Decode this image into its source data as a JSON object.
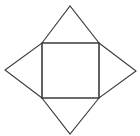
{
  "diagram": {
    "type": "square-pyramid-net",
    "width": 140,
    "height": 136,
    "background": "#ffffff",
    "stroke_color": "#3a3a3a",
    "square": {
      "top_left": [
        42,
        43
      ],
      "top_right": [
        99,
        43
      ],
      "bottom_right": [
        99,
        98
      ],
      "bottom_left": [
        42,
        98
      ]
    },
    "triangles": [
      {
        "name": "top",
        "apex": [
          70,
          6
        ]
      },
      {
        "name": "right",
        "apex": [
          136,
          71
        ]
      },
      {
        "name": "bottom",
        "apex": [
          70,
          134
        ]
      },
      {
        "name": "left",
        "apex": [
          5,
          70
        ]
      }
    ]
  }
}
